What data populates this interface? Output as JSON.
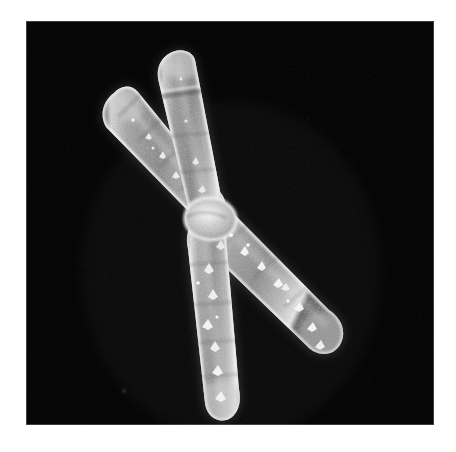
{
  "image": {
    "kind": "scanning-electron-micrograph",
    "subject": "duplicated metaphase chromosome",
    "alt_text": "Scanning electron micrograph of a duplicated X-shaped chromosome on a black background",
    "canvas": {
      "width": 456,
      "height": 452
    },
    "frame": {
      "x": 26,
      "y": 21,
      "width": 408,
      "height": 404
    },
    "page_background_color": "#ffffff",
    "field_background_color": "#000000",
    "specimen_color": "#b9b9b9",
    "specimen_highlight_color": "#f2f2f2",
    "specimen_shadow_color": "#4a4a4a"
  },
  "specimen": {
    "structures": [
      {
        "id": "p-arm-left",
        "label": "short arm (left chromatid)"
      },
      {
        "id": "p-arm-right",
        "label": "short arm (right chromatid)"
      },
      {
        "id": "centromere",
        "label": "centromere constriction"
      },
      {
        "id": "q-arm-left",
        "label": "long arm (left chromatid)"
      },
      {
        "id": "q-arm-right",
        "label": "long arm (right chromatid)"
      }
    ]
  },
  "caption": {
    "text": ""
  }
}
